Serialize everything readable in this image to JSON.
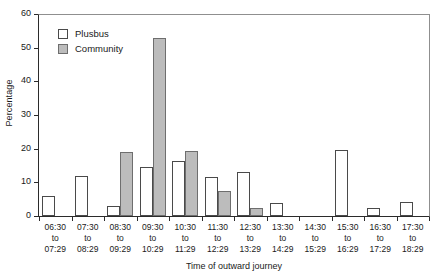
{
  "chart_data": {
    "type": "bar",
    "title": "",
    "subtitle": "",
    "xlabel": "Time of outward journey",
    "ylabel": "Percentage",
    "ylim": [
      0,
      60
    ],
    "yticks": [
      0,
      10,
      20,
      30,
      40,
      50,
      60
    ],
    "grid": false,
    "legend_position": "top-left",
    "categories": [
      "06:30\nto\n07:29",
      "07:30\nto\n08:29",
      "08:30\nto\n09:29",
      "09:30\nto\n10:29",
      "10:30\nto\n11:29",
      "11:30\nto\n12:29",
      "12:30\nto\n13:29",
      "13:30\nto\n14:29",
      "14:30\nto\n15:29",
      "15:30\nto\n16:29",
      "16:30\nto\n17:29",
      "17:30\nto\n18:29"
    ],
    "category_lines": [
      [
        "06:30",
        "to",
        "07:29"
      ],
      [
        "07:30",
        "to",
        "08:29"
      ],
      [
        "08:30",
        "to",
        "09:29"
      ],
      [
        "09:30",
        "to",
        "10:29"
      ],
      [
        "10:30",
        "to",
        "11:29"
      ],
      [
        "11:30",
        "to",
        "12:29"
      ],
      [
        "12:30",
        "to",
        "13:29"
      ],
      [
        "13:30",
        "to",
        "14:29"
      ],
      [
        "14:30",
        "to",
        "15:29"
      ],
      [
        "15:30",
        "to",
        "16:29"
      ],
      [
        "16:30",
        "to",
        "17:29"
      ],
      [
        "17:30",
        "to",
        "18:29"
      ]
    ],
    "series": [
      {
        "name": "Plusbus",
        "color": "#ffffff",
        "edge_color": "#4a4a4a",
        "values": [
          6,
          12,
          3,
          14.7,
          16.4,
          11.5,
          13,
          4,
          0,
          19.5,
          2.3,
          4.2
        ]
      },
      {
        "name": "Community",
        "color": "#bcbcbc",
        "edge_color": "#6e6e6e",
        "values": [
          0,
          0,
          19,
          53,
          19.2,
          7.3,
          2.3,
          0,
          0,
          0,
          0,
          0
        ]
      }
    ]
  },
  "legend": {
    "items": [
      {
        "label": "Plusbus",
        "swatch": "plusbus"
      },
      {
        "label": "Community",
        "swatch": "community"
      }
    ]
  },
  "axes": {
    "y_title": "Percentage",
    "x_title": "Time of outward journey",
    "y_tick_labels": [
      "0",
      "10",
      "20",
      "30",
      "40",
      "50",
      "60"
    ]
  }
}
